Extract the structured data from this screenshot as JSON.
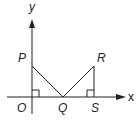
{
  "diagram": {
    "axes": {
      "x_label": "x",
      "y_label": "y"
    },
    "points": {
      "O": {
        "label": "O"
      },
      "P": {
        "label": "P"
      },
      "Q": {
        "label": "Q"
      },
      "R": {
        "label": "R"
      },
      "S": {
        "label": "S"
      }
    },
    "segments": [
      "PQ",
      "QR",
      "RS"
    ],
    "right_angles": [
      "O",
      "S"
    ],
    "colors": {
      "stroke": "#222222",
      "background": "#ffffff"
    }
  }
}
